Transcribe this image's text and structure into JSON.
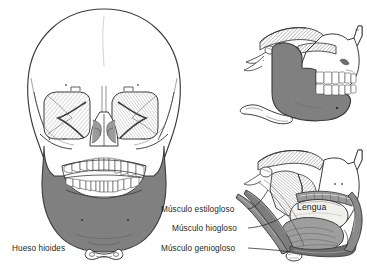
{
  "figure": {
    "background_color": "#ffffff",
    "line_color": "#3a3a3a",
    "bone_shade_color": "#808080",
    "tooth_color": "#ffffff",
    "text_color": "#231f20",
    "panels": [
      {
        "name": "anterior-skull-view",
        "description": "Vista anterior del craneo"
      },
      {
        "name": "lateral-bone-view",
        "description": "Vista lateral de mandibula y maxilar"
      },
      {
        "name": "lateral-muscle-view",
        "description": "Vista lateral de los musculos de la lengua"
      }
    ]
  },
  "labels": {
    "hueso_hioides": "Hueso hioides",
    "musculo_estilogloso": "Músculo estilogloso",
    "musculo_hiogloso": "Músculo hiogloso",
    "musculo_geniogloso": "Músculo geniogloso",
    "lengua": "Lengua"
  }
}
